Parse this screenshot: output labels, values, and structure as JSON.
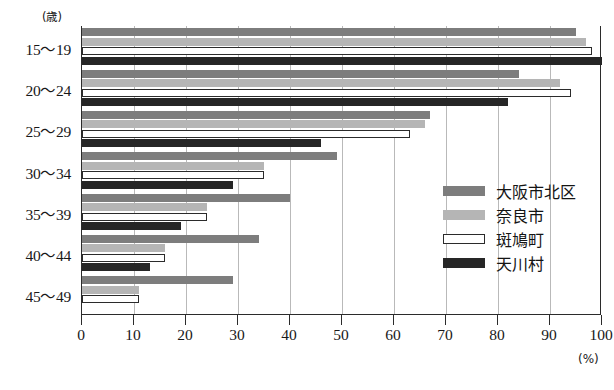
{
  "chart_data": {
    "type": "bar",
    "orientation": "horizontal",
    "title": "",
    "xlabel": "(%)",
    "ylabel": "(歳)",
    "xlim": [
      0,
      100
    ],
    "xticks": [
      0,
      10,
      20,
      30,
      40,
      50,
      60,
      70,
      80,
      90,
      100
    ],
    "xticklabels": [
      "0",
      "10",
      "20",
      "30",
      "40",
      "50",
      "60",
      "70",
      "80",
      "90",
      "100"
    ],
    "grid": true,
    "grid_axis": "x",
    "legend_position": "center-right",
    "categories": [
      "15～19",
      "20～24",
      "25～29",
      "30～34",
      "35～39",
      "40～44",
      "45～49"
    ],
    "series": [
      {
        "name": "大阪市北区",
        "color": "#7d7d7d",
        "values": [
          95,
          84,
          67,
          49,
          40,
          34,
          29
        ]
      },
      {
        "name": "奈良市",
        "color": "#b5b5b5",
        "values": [
          97,
          92,
          66,
          35,
          24,
          16,
          11
        ]
      },
      {
        "name": "斑鳩町",
        "color": "#ffffff",
        "values": [
          98,
          94,
          63,
          35,
          24,
          16,
          11
        ]
      },
      {
        "name": "天川村",
        "color": "#262626",
        "values": [
          100,
          82,
          46,
          29,
          19,
          13,
          0
        ]
      }
    ]
  },
  "legend": {
    "items": [
      {
        "label": "大阪市北区"
      },
      {
        "label": "奈良市"
      },
      {
        "label": "斑鳩町"
      },
      {
        "label": "天川村"
      }
    ]
  },
  "axes": {
    "y_unit": "(歳)",
    "x_unit": "(%)"
  }
}
